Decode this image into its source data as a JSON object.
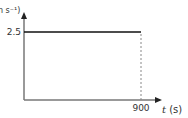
{
  "chart_data": {
    "type": "line",
    "title": "",
    "xlabel_var": "t",
    "xlabel_unit": " (s)",
    "ylabel": "n s⁻¹)",
    "x_ticks": [
      "900"
    ],
    "y_ticks": [
      "2.5"
    ],
    "xlim": [
      0,
      1050
    ],
    "ylim": [
      0,
      3.5
    ],
    "series": [
      {
        "name": "velocity",
        "x": [
          0,
          900
        ],
        "y": [
          2.5,
          2.5
        ],
        "style": "solid"
      }
    ],
    "guides": [
      {
        "name": "drop-line-900",
        "x": [
          900,
          900
        ],
        "y": [
          0,
          2.5
        ],
        "style": "dashed"
      }
    ],
    "grid": false,
    "legend": "none"
  },
  "colors": {
    "line": "#111111",
    "axis": "#777777",
    "dashed": "#888888",
    "text": "#333333"
  }
}
